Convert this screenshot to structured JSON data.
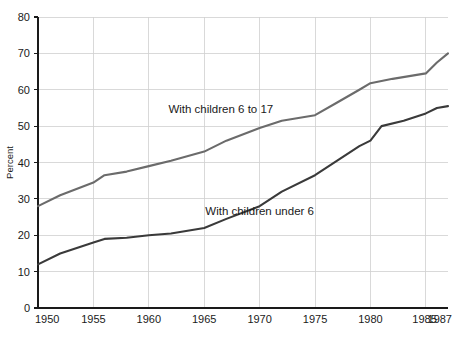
{
  "chart_data": {
    "type": "line",
    "title": "",
    "subtitle": "",
    "xlabel": "",
    "ylabel": "Percent",
    "xlim": [
      1950,
      1987
    ],
    "ylim": [
      0,
      80
    ],
    "grid": true,
    "legend_position": "inline-annotations",
    "x_ticks": [
      "1950",
      "1955",
      "1960",
      "1965",
      "1970",
      "1975",
      "1980",
      "1985",
      "1987"
    ],
    "x_tick_values": [
      1950,
      1955,
      1960,
      1965,
      1970,
      1975,
      1980,
      1985,
      1987
    ],
    "y_ticks": [
      "0",
      "10",
      "20",
      "30",
      "40",
      "50",
      "60",
      "70",
      "80"
    ],
    "y_tick_values": [
      0,
      10,
      20,
      30,
      40,
      50,
      60,
      70,
      80
    ],
    "series": [
      {
        "name": "With children 6 to 17",
        "color": "#6b6b6b",
        "label_x": 1966.5,
        "label_y": 53.5,
        "x": [
          1950,
          1952,
          1955,
          1956,
          1958,
          1960,
          1962,
          1965,
          1967,
          1970,
          1972,
          1975,
          1977,
          1979,
          1980,
          1982,
          1985,
          1986,
          1987
        ],
        "values": [
          28.0,
          31.0,
          34.5,
          36.5,
          37.5,
          39.0,
          40.5,
          43.0,
          46.0,
          49.5,
          51.5,
          53.0,
          56.5,
          60.0,
          61.8,
          63.0,
          64.5,
          67.5,
          70.0
        ]
      },
      {
        "name": "With children under 6",
        "color": "#3a3a3a",
        "label_x": 1970.0,
        "label_y": 25.5,
        "x": [
          1950,
          1952,
          1955,
          1956,
          1958,
          1960,
          1962,
          1965,
          1967,
          1970,
          1972,
          1975,
          1977,
          1979,
          1980,
          1981,
          1983,
          1985,
          1986,
          1987
        ],
        "values": [
          12.0,
          15.0,
          18.0,
          19.0,
          19.3,
          20.0,
          20.5,
          22.0,
          24.5,
          28.0,
          32.0,
          36.5,
          40.5,
          44.5,
          46.0,
          50.0,
          51.5,
          53.5,
          55.0,
          55.5
        ]
      }
    ]
  },
  "geometry": {
    "plot_left": 38,
    "plot_right": 448,
    "plot_top": 17,
    "plot_bottom": 308
  }
}
